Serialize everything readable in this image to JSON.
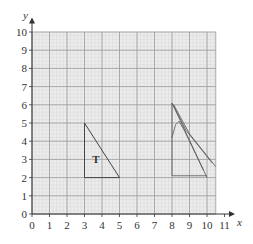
{
  "figure": {
    "axes": {
      "x_label": "x",
      "y_label": "y",
      "x_ticks": [
        "0",
        "1",
        "2",
        "3",
        "4",
        "5",
        "6",
        "7",
        "8",
        "9",
        "10",
        "11"
      ],
      "y_ticks": [
        "0",
        "1",
        "2",
        "3",
        "4",
        "5",
        "6",
        "7",
        "8",
        "9",
        "10"
      ],
      "x_range": [
        0,
        10.5
      ],
      "y_range": [
        0,
        10
      ]
    },
    "grid": {
      "minor_step": 0.2,
      "major_step": 1,
      "background": "#ececec",
      "major_color": "#9a9a9a",
      "minor_color": "#d8d8d8"
    },
    "shape_T": {
      "label": "T",
      "vertices": [
        [
          3,
          5
        ],
        [
          3,
          2
        ],
        [
          5,
          2
        ]
      ],
      "stroke": "#444444"
    },
    "pencil_sketch": {
      "stroke": "#555555",
      "description": "hand-drawn attempted transformation of triangle near x=8 to 10.5",
      "paths": [
        [
          [
            8,
            6.1
          ],
          [
            8,
            2.1
          ],
          [
            10,
            2.1
          ]
        ],
        [
          [
            8,
            6.1
          ],
          [
            10,
            2.0
          ]
        ],
        [
          [
            8,
            6.1
          ],
          [
            8.8,
            4.6
          ],
          [
            10.3,
            2.8
          ]
        ],
        [
          [
            8.1,
            6.0
          ],
          [
            9,
            4.4
          ],
          [
            10.5,
            2.6
          ]
        ],
        [
          [
            8,
            4.2
          ],
          [
            8.2,
            4.9
          ],
          [
            8.4,
            5.1
          ],
          [
            8.7,
            4.6
          ],
          [
            9.3,
            3.4
          ],
          [
            9.8,
            2.4
          ]
        ]
      ]
    }
  }
}
